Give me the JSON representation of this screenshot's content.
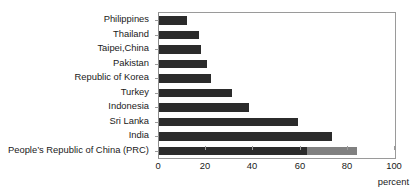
{
  "chart_data": {
    "type": "bar",
    "orientation": "horizontal",
    "stacked": true,
    "title": "",
    "xlabel": "percent",
    "ylabel": "",
    "xlim": [
      0,
      100
    ],
    "xticks": [
      0,
      20,
      40,
      60,
      80,
      100
    ],
    "xticklabels": [
      "0",
      "20",
      "40",
      "60",
      "80",
      "100"
    ],
    "grid": false,
    "legend": "none",
    "categories": [
      "Philippines",
      "Thailand",
      "Taipei,China",
      "Pakistan",
      "Republic of Korea",
      "Turkey",
      "Indonesia",
      "Sri Lanka",
      "India",
      "People’s Republic of China (PRC)"
    ],
    "series": [
      {
        "name": "primary",
        "color": "#2b2b2b",
        "values": [
          12,
          17,
          18,
          20.5,
          22,
          31,
          38,
          59,
          73.5,
          62.5
        ]
      },
      {
        "name": "secondary",
        "color": "#808080",
        "values": [
          0,
          0,
          0,
          0,
          0,
          0,
          0,
          0,
          0,
          21.5
        ]
      }
    ],
    "totals": [
      12,
      17,
      18,
      20.5,
      22,
      31,
      38,
      59,
      73.5,
      84
    ]
  },
  "axis": {
    "x_title": "percent"
  },
  "colors": {
    "bar_primary": "#2b2b2b",
    "bar_secondary": "#808080",
    "frame": "#9a9a9a",
    "text": "#1a1a1a",
    "background": "#ffffff"
  }
}
